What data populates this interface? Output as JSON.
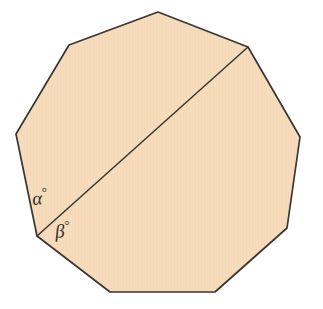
{
  "figure": {
    "name": "regular-nonagon-with-diagonal",
    "shape_label": "nonagon",
    "sides": 9,
    "background_color": "#ffffff",
    "fill_color": "#f7dcbc",
    "stroke_color": "#3a3632",
    "stroke_width": 1.7,
    "diagonal_stroke_width": 1.5,
    "canvas": {
      "width": 323,
      "height": 309
    },
    "vertices": [
      {
        "name": "top",
        "x": 158,
        "y": 12
      },
      {
        "name": "upper-right",
        "x": 248,
        "y": 47
      },
      {
        "name": "right",
        "x": 300,
        "y": 137
      },
      {
        "name": "lower-right",
        "x": 287,
        "y": 228
      },
      {
        "name": "bottom-right",
        "x": 215,
        "y": 292
      },
      {
        "name": "bottom-left",
        "x": 110,
        "y": 292
      },
      {
        "name": "lower-left",
        "x": 37,
        "y": 236
      },
      {
        "name": "left",
        "x": 16,
        "y": 134
      },
      {
        "name": "upper-left",
        "x": 69,
        "y": 45
      }
    ],
    "diagonal": {
      "name": "diagonal-lower-left-to-upper-right",
      "from": {
        "x": 37,
        "y": 236
      },
      "to": {
        "x": 248,
        "y": 47
      }
    },
    "labels": {
      "alpha": {
        "symbol": "α",
        "degree": "°",
        "text": "α°",
        "x": 32,
        "y": 186
      },
      "beta": {
        "symbol": "β",
        "degree": "°",
        "text": "β°",
        "x": 55,
        "y": 219
      }
    }
  }
}
